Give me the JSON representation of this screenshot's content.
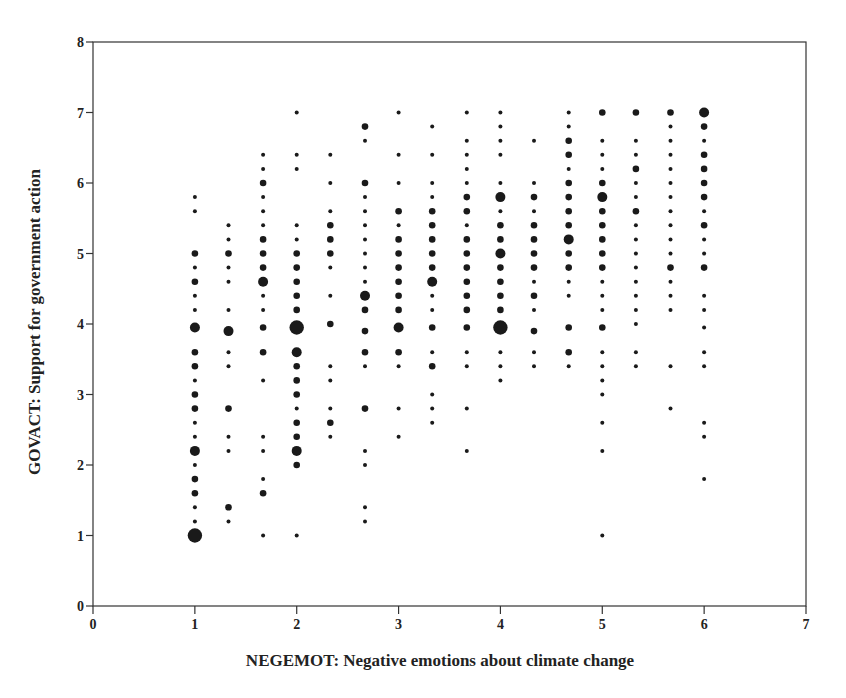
{
  "chart_data": {
    "type": "scatter",
    "title": "",
    "xlabel": "NEGEMOT: Negative emotions about climate change",
    "ylabel": "GOVACT: Support for government action",
    "xlim": [
      0,
      7
    ],
    "ylim": [
      0,
      8
    ],
    "xticks": [
      0,
      1,
      2,
      3,
      4,
      5,
      6,
      7
    ],
    "yticks": [
      0,
      1,
      2,
      3,
      4,
      5,
      6,
      7,
      8
    ],
    "grid": false,
    "legend": null,
    "marker_size_note": "marker size proportional to number of overlapping cases (1=smallest, 4=largest)",
    "points": [
      [
        1,
        5.8,
        1
      ],
      [
        1,
        5.6,
        1
      ],
      [
        1,
        5.0,
        2
      ],
      [
        1,
        4.8,
        1
      ],
      [
        1,
        4.6,
        2
      ],
      [
        1,
        4.4,
        1
      ],
      [
        1,
        4.2,
        1
      ],
      [
        1,
        3.95,
        3
      ],
      [
        1,
        3.6,
        2
      ],
      [
        1,
        3.4,
        2
      ],
      [
        1,
        3.2,
        1
      ],
      [
        1,
        3.0,
        2
      ],
      [
        1,
        2.8,
        2
      ],
      [
        1,
        2.6,
        1
      ],
      [
        1,
        2.4,
        1
      ],
      [
        1,
        2.2,
        3
      ],
      [
        1,
        2.0,
        1
      ],
      [
        1,
        1.8,
        2
      ],
      [
        1,
        1.6,
        2
      ],
      [
        1,
        1.4,
        1
      ],
      [
        1,
        1.2,
        1
      ],
      [
        1,
        1.0,
        4
      ],
      [
        1.33,
        5.4,
        1
      ],
      [
        1.33,
        5.2,
        1
      ],
      [
        1.33,
        5.0,
        2
      ],
      [
        1.33,
        4.8,
        1
      ],
      [
        1.33,
        4.6,
        1
      ],
      [
        1.33,
        4.2,
        1
      ],
      [
        1.33,
        3.9,
        3
      ],
      [
        1.33,
        3.6,
        1
      ],
      [
        1.33,
        3.4,
        1
      ],
      [
        1.33,
        2.8,
        2
      ],
      [
        1.33,
        2.4,
        1
      ],
      [
        1.33,
        2.2,
        1
      ],
      [
        1.33,
        1.4,
        2
      ],
      [
        1.33,
        1.2,
        1
      ],
      [
        1.67,
        6.4,
        1
      ],
      [
        1.67,
        6.2,
        1
      ],
      [
        1.67,
        6.0,
        2
      ],
      [
        1.67,
        5.8,
        1
      ],
      [
        1.67,
        5.6,
        1
      ],
      [
        1.67,
        5.4,
        1
      ],
      [
        1.67,
        5.2,
        2
      ],
      [
        1.67,
        5.0,
        2
      ],
      [
        1.67,
        4.8,
        2
      ],
      [
        1.67,
        4.6,
        3
      ],
      [
        1.67,
        4.4,
        1
      ],
      [
        1.67,
        4.2,
        1
      ],
      [
        1.67,
        3.95,
        2
      ],
      [
        1.67,
        3.6,
        2
      ],
      [
        1.67,
        3.2,
        1
      ],
      [
        1.67,
        2.4,
        1
      ],
      [
        1.67,
        2.2,
        1
      ],
      [
        1.67,
        1.8,
        1
      ],
      [
        1.67,
        1.6,
        2
      ],
      [
        1.67,
        1.0,
        1
      ],
      [
        2,
        7.0,
        1
      ],
      [
        2,
        6.4,
        1
      ],
      [
        2,
        6.2,
        1
      ],
      [
        2,
        5.4,
        1
      ],
      [
        2,
        5.2,
        1
      ],
      [
        2,
        5.0,
        2
      ],
      [
        2,
        4.8,
        2
      ],
      [
        2,
        4.6,
        2
      ],
      [
        2,
        4.4,
        2
      ],
      [
        2,
        4.2,
        2
      ],
      [
        2,
        3.95,
        4
      ],
      [
        2,
        3.6,
        3
      ],
      [
        2,
        3.4,
        2
      ],
      [
        2,
        3.2,
        2
      ],
      [
        2,
        3.0,
        2
      ],
      [
        2,
        2.8,
        1
      ],
      [
        2,
        2.6,
        2
      ],
      [
        2,
        2.4,
        2
      ],
      [
        2,
        2.2,
        3
      ],
      [
        2,
        2.0,
        2
      ],
      [
        2,
        1.0,
        1
      ],
      [
        2.33,
        6.4,
        1
      ],
      [
        2.33,
        6.0,
        1
      ],
      [
        2.33,
        5.6,
        1
      ],
      [
        2.33,
        5.4,
        2
      ],
      [
        2.33,
        5.2,
        2
      ],
      [
        2.33,
        5.0,
        2
      ],
      [
        2.33,
        4.8,
        1
      ],
      [
        2.33,
        4.4,
        1
      ],
      [
        2.33,
        4.0,
        2
      ],
      [
        2.33,
        3.4,
        1
      ],
      [
        2.33,
        3.2,
        1
      ],
      [
        2.33,
        2.8,
        1
      ],
      [
        2.33,
        2.6,
        2
      ],
      [
        2.33,
        2.4,
        1
      ],
      [
        2.67,
        6.8,
        2
      ],
      [
        2.67,
        6.6,
        1
      ],
      [
        2.67,
        6.0,
        2
      ],
      [
        2.67,
        5.8,
        1
      ],
      [
        2.67,
        5.6,
        1
      ],
      [
        2.67,
        5.4,
        1
      ],
      [
        2.67,
        5.2,
        1
      ],
      [
        2.67,
        5.0,
        1
      ],
      [
        2.67,
        4.8,
        1
      ],
      [
        2.67,
        4.6,
        1
      ],
      [
        2.67,
        4.4,
        3
      ],
      [
        2.67,
        4.2,
        2
      ],
      [
        2.67,
        3.9,
        2
      ],
      [
        2.67,
        3.6,
        2
      ],
      [
        2.67,
        3.4,
        1
      ],
      [
        2.67,
        2.8,
        2
      ],
      [
        2.67,
        2.2,
        1
      ],
      [
        2.67,
        2.0,
        1
      ],
      [
        2.67,
        1.4,
        1
      ],
      [
        2.67,
        1.2,
        1
      ],
      [
        3,
        7.0,
        1
      ],
      [
        3,
        6.4,
        1
      ],
      [
        3,
        6.0,
        1
      ],
      [
        3,
        5.6,
        2
      ],
      [
        3,
        5.4,
        1
      ],
      [
        3,
        5.2,
        2
      ],
      [
        3,
        5.0,
        2
      ],
      [
        3,
        4.8,
        2
      ],
      [
        3,
        4.6,
        2
      ],
      [
        3,
        4.4,
        2
      ],
      [
        3,
        4.2,
        2
      ],
      [
        3,
        3.95,
        3
      ],
      [
        3,
        3.6,
        2
      ],
      [
        3,
        3.4,
        1
      ],
      [
        3,
        2.8,
        1
      ],
      [
        3,
        2.4,
        1
      ],
      [
        3.33,
        6.8,
        1
      ],
      [
        3.33,
        6.4,
        1
      ],
      [
        3.33,
        6.0,
        1
      ],
      [
        3.33,
        5.8,
        1
      ],
      [
        3.33,
        5.6,
        2
      ],
      [
        3.33,
        5.4,
        2
      ],
      [
        3.33,
        5.2,
        2
      ],
      [
        3.33,
        5.0,
        2
      ],
      [
        3.33,
        4.8,
        2
      ],
      [
        3.33,
        4.6,
        3
      ],
      [
        3.33,
        4.4,
        1
      ],
      [
        3.33,
        4.2,
        1
      ],
      [
        3.33,
        3.95,
        2
      ],
      [
        3.33,
        3.6,
        1
      ],
      [
        3.33,
        3.4,
        2
      ],
      [
        3.33,
        3.0,
        1
      ],
      [
        3.33,
        2.8,
        1
      ],
      [
        3.33,
        2.6,
        1
      ],
      [
        3.67,
        7.0,
        1
      ],
      [
        3.67,
        6.6,
        1
      ],
      [
        3.67,
        6.4,
        1
      ],
      [
        3.67,
        6.2,
        1
      ],
      [
        3.67,
        6.0,
        1
      ],
      [
        3.67,
        5.8,
        2
      ],
      [
        3.67,
        5.6,
        2
      ],
      [
        3.67,
        5.4,
        1
      ],
      [
        3.67,
        5.2,
        2
      ],
      [
        3.67,
        5.0,
        2
      ],
      [
        3.67,
        4.8,
        2
      ],
      [
        3.67,
        4.6,
        2
      ],
      [
        3.67,
        4.4,
        2
      ],
      [
        3.67,
        4.2,
        2
      ],
      [
        3.67,
        3.95,
        2
      ],
      [
        3.67,
        3.6,
        1
      ],
      [
        3.67,
        3.4,
        1
      ],
      [
        3.67,
        2.8,
        1
      ],
      [
        3.67,
        2.2,
        1
      ],
      [
        4,
        7.0,
        1
      ],
      [
        4,
        6.8,
        1
      ],
      [
        4,
        6.6,
        1
      ],
      [
        4,
        6.4,
        1
      ],
      [
        4,
        6.0,
        1
      ],
      [
        4,
        5.8,
        3
      ],
      [
        4,
        5.6,
        1
      ],
      [
        4,
        5.4,
        2
      ],
      [
        4,
        5.2,
        2
      ],
      [
        4,
        5.0,
        3
      ],
      [
        4,
        4.8,
        2
      ],
      [
        4,
        4.6,
        2
      ],
      [
        4,
        4.4,
        2
      ],
      [
        4,
        4.2,
        2
      ],
      [
        4,
        3.95,
        4
      ],
      [
        4,
        3.6,
        1
      ],
      [
        4,
        3.4,
        1
      ],
      [
        4,
        3.2,
        1
      ],
      [
        4.33,
        6.6,
        1
      ],
      [
        4.33,
        6.0,
        1
      ],
      [
        4.33,
        5.8,
        2
      ],
      [
        4.33,
        5.6,
        1
      ],
      [
        4.33,
        5.4,
        2
      ],
      [
        4.33,
        5.2,
        2
      ],
      [
        4.33,
        5.0,
        2
      ],
      [
        4.33,
        4.8,
        2
      ],
      [
        4.33,
        4.6,
        1
      ],
      [
        4.33,
        4.4,
        2
      ],
      [
        4.33,
        4.2,
        1
      ],
      [
        4.33,
        3.9,
        2
      ],
      [
        4.33,
        3.6,
        1
      ],
      [
        4.33,
        3.4,
        1
      ],
      [
        4.67,
        7.0,
        1
      ],
      [
        4.67,
        6.8,
        1
      ],
      [
        4.67,
        6.6,
        2
      ],
      [
        4.67,
        6.4,
        2
      ],
      [
        4.67,
        6.2,
        1
      ],
      [
        4.67,
        6.0,
        2
      ],
      [
        4.67,
        5.8,
        2
      ],
      [
        4.67,
        5.6,
        2
      ],
      [
        4.67,
        5.4,
        2
      ],
      [
        4.67,
        5.2,
        3
      ],
      [
        4.67,
        5.0,
        2
      ],
      [
        4.67,
        4.8,
        2
      ],
      [
        4.67,
        4.6,
        1
      ],
      [
        4.67,
        4.4,
        1
      ],
      [
        4.67,
        3.95,
        2
      ],
      [
        4.67,
        3.6,
        2
      ],
      [
        4.67,
        3.4,
        1
      ],
      [
        5,
        7.0,
        2
      ],
      [
        5,
        6.6,
        1
      ],
      [
        5,
        6.4,
        1
      ],
      [
        5,
        6.2,
        1
      ],
      [
        5,
        6.0,
        2
      ],
      [
        5,
        5.8,
        3
      ],
      [
        5,
        5.6,
        2
      ],
      [
        5,
        5.4,
        2
      ],
      [
        5,
        5.2,
        2
      ],
      [
        5,
        5.0,
        2
      ],
      [
        5,
        4.8,
        2
      ],
      [
        5,
        4.6,
        1
      ],
      [
        5,
        4.4,
        1
      ],
      [
        5,
        4.2,
        1
      ],
      [
        5,
        3.95,
        2
      ],
      [
        5,
        3.6,
        1
      ],
      [
        5,
        3.4,
        1
      ],
      [
        5,
        3.2,
        1
      ],
      [
        5,
        3.0,
        1
      ],
      [
        5,
        2.6,
        1
      ],
      [
        5,
        2.2,
        1
      ],
      [
        5,
        1.0,
        1
      ],
      [
        5.33,
        7.0,
        2
      ],
      [
        5.33,
        6.6,
        1
      ],
      [
        5.33,
        6.4,
        1
      ],
      [
        5.33,
        6.2,
        2
      ],
      [
        5.33,
        6.0,
        1
      ],
      [
        5.33,
        5.8,
        1
      ],
      [
        5.33,
        5.6,
        2
      ],
      [
        5.33,
        5.4,
        1
      ],
      [
        5.33,
        5.2,
        1
      ],
      [
        5.33,
        5.0,
        1
      ],
      [
        5.33,
        4.8,
        1
      ],
      [
        5.33,
        4.6,
        1
      ],
      [
        5.33,
        4.4,
        1
      ],
      [
        5.33,
        4.2,
        1
      ],
      [
        5.33,
        4.0,
        1
      ],
      [
        5.33,
        3.6,
        1
      ],
      [
        5.33,
        3.4,
        1
      ],
      [
        5.67,
        7.0,
        2
      ],
      [
        5.67,
        6.8,
        1
      ],
      [
        5.67,
        6.6,
        1
      ],
      [
        5.67,
        6.4,
        1
      ],
      [
        5.67,
        6.2,
        1
      ],
      [
        5.67,
        6.0,
        1
      ],
      [
        5.67,
        5.8,
        1
      ],
      [
        5.67,
        5.6,
        1
      ],
      [
        5.67,
        5.4,
        1
      ],
      [
        5.67,
        5.2,
        1
      ],
      [
        5.67,
        5.0,
        1
      ],
      [
        5.67,
        4.8,
        2
      ],
      [
        5.67,
        4.6,
        1
      ],
      [
        5.67,
        4.4,
        1
      ],
      [
        5.67,
        4.2,
        1
      ],
      [
        5.67,
        3.4,
        1
      ],
      [
        5.67,
        2.8,
        1
      ],
      [
        6,
        7.0,
        3
      ],
      [
        6,
        6.8,
        2
      ],
      [
        6,
        6.6,
        1
      ],
      [
        6,
        6.4,
        2
      ],
      [
        6,
        6.2,
        2
      ],
      [
        6,
        6.0,
        2
      ],
      [
        6,
        5.8,
        2
      ],
      [
        6,
        5.6,
        1
      ],
      [
        6,
        5.4,
        2
      ],
      [
        6,
        5.2,
        1
      ],
      [
        6,
        5.0,
        1
      ],
      [
        6,
        4.8,
        2
      ],
      [
        6,
        4.4,
        1
      ],
      [
        6,
        4.2,
        1
      ],
      [
        6,
        3.95,
        1
      ],
      [
        6,
        3.6,
        1
      ],
      [
        6,
        3.4,
        1
      ],
      [
        6,
        2.6,
        1
      ],
      [
        6,
        2.4,
        1
      ],
      [
        6,
        1.8,
        1
      ]
    ]
  },
  "style": {
    "marker_color": "#1a1a1a",
    "axis_color": "#333333",
    "background": "#ffffff"
  }
}
